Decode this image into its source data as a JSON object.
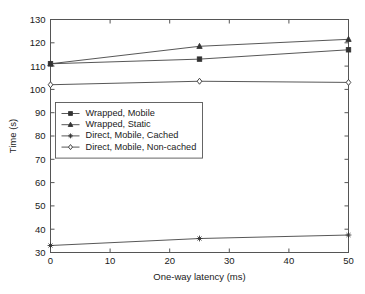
{
  "chart_data": {
    "type": "line",
    "title": "",
    "xlabel": "One-way latency (ms)",
    "ylabel": "Time (s)",
    "x": [
      0,
      25,
      50
    ],
    "xlim": [
      0,
      50
    ],
    "ylim": [
      30,
      130
    ],
    "xticks": [
      "0",
      "10",
      "20",
      "30",
      "40",
      "50"
    ],
    "xtick_values": [
      0,
      10,
      20,
      30,
      40,
      50
    ],
    "yticks": [
      "30",
      "40",
      "50",
      "60",
      "70",
      "80",
      "90",
      "100",
      "110",
      "120",
      "130"
    ],
    "ytick_values": [
      30,
      40,
      50,
      60,
      70,
      80,
      90,
      100,
      110,
      120,
      130
    ],
    "grid": false,
    "legend_position": "center-left",
    "series": [
      {
        "name": "Wrapped, Mobile",
        "marker": "square-filled",
        "values": [
          111,
          113,
          117
        ]
      },
      {
        "name": "Wrapped, Static",
        "marker": "triangle-filled",
        "values": [
          111,
          118.5,
          121.5
        ]
      },
      {
        "name": "Direct, Mobile, Cached",
        "marker": "star-filled",
        "values": [
          33,
          36,
          37.5
        ]
      },
      {
        "name": "Direct, Mobile, Non-cached",
        "marker": "diamond-open",
        "values": [
          102,
          103.5,
          103
        ]
      }
    ]
  },
  "colors": {
    "line": "#444444",
    "axis": "#555555",
    "text": "#1a1a1a",
    "background": "#ffffff"
  }
}
